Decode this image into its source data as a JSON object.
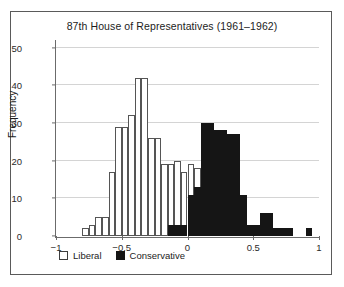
{
  "figure": {
    "background": "#ffffff",
    "frame_color": "#5a5a5a"
  },
  "legend": {
    "position": "bottom-left",
    "entries": [
      {
        "label": "Liberal",
        "color": "#ffffff",
        "edge": "#3d3d3d",
        "swatch": "hollow-square-icon"
      },
      {
        "label": "Conservative",
        "color": "#151515",
        "edge": "#151515",
        "swatch": "filled-square-icon"
      }
    ]
  },
  "chart_data": {
    "type": "bar",
    "title": "87th House of Representatives (1961–1962)",
    "subtitle": "",
    "xlabel": "",
    "ylabel": "Frequency",
    "xlim": [
      -1,
      1
    ],
    "ylim": [
      0,
      52
    ],
    "xticks": [
      -1,
      -0.5,
      0,
      0.5,
      1
    ],
    "xtick_labels": [
      "−1",
      "−0.5",
      "0",
      "0.5",
      "1"
    ],
    "yticks": [
      0,
      10,
      20,
      30,
      40,
      50
    ],
    "ytick_labels": [
      "0",
      "10",
      "20",
      "30",
      "40",
      "50"
    ],
    "grid": "horizontal",
    "grid_color": "#d4d4d4",
    "bin_width": 0.05,
    "series": [
      {
        "name": "Liberal",
        "color": "#ffffff",
        "edge_color": "#555555",
        "bins": [
          {
            "x0": -0.8,
            "x1": -0.75,
            "value": 2
          },
          {
            "x0": -0.75,
            "x1": -0.7,
            "value": 3
          },
          {
            "x0": -0.7,
            "x1": -0.65,
            "value": 5
          },
          {
            "x0": -0.65,
            "x1": -0.6,
            "value": 5
          },
          {
            "x0": -0.6,
            "x1": -0.55,
            "value": 17
          },
          {
            "x0": -0.55,
            "x1": -0.5,
            "value": 29
          },
          {
            "x0": -0.5,
            "x1": -0.45,
            "value": 29
          },
          {
            "x0": -0.45,
            "x1": -0.4,
            "value": 32
          },
          {
            "x0": -0.4,
            "x1": -0.35,
            "value": 42
          },
          {
            "x0": -0.35,
            "x1": -0.3,
            "value": 42
          },
          {
            "x0": -0.3,
            "x1": -0.25,
            "value": 26
          },
          {
            "x0": -0.25,
            "x1": -0.2,
            "value": 26
          },
          {
            "x0": -0.2,
            "x1": -0.15,
            "value": 19
          },
          {
            "x0": -0.15,
            "x1": -0.1,
            "value": 19
          },
          {
            "x0": -0.1,
            "x1": -0.05,
            "value": 20
          },
          {
            "x0": -0.05,
            "x1": 0.0,
            "value": 17
          },
          {
            "x0": 0.0,
            "x1": 0.05,
            "value": 19
          },
          {
            "x0": 0.05,
            "x1": 0.1,
            "value": 18
          }
        ]
      },
      {
        "name": "Conservative",
        "color": "#151515",
        "edge_color": "#151515",
        "bins": [
          {
            "x0": -0.15,
            "x1": -0.1,
            "value": 3
          },
          {
            "x0": -0.1,
            "x1": -0.05,
            "value": 3
          },
          {
            "x0": -0.05,
            "x1": 0.0,
            "value": 3
          },
          {
            "x0": 0.0,
            "x1": 0.05,
            "value": 11
          },
          {
            "x0": 0.05,
            "x1": 0.1,
            "value": 13
          },
          {
            "x0": 0.1,
            "x1": 0.15,
            "value": 30
          },
          {
            "x0": 0.15,
            "x1": 0.2,
            "value": 30
          },
          {
            "x0": 0.2,
            "x1": 0.25,
            "value": 28
          },
          {
            "x0": 0.25,
            "x1": 0.3,
            "value": 28
          },
          {
            "x0": 0.3,
            "x1": 0.35,
            "value": 27
          },
          {
            "x0": 0.35,
            "x1": 0.4,
            "value": 27
          },
          {
            "x0": 0.4,
            "x1": 0.45,
            "value": 11
          },
          {
            "x0": 0.45,
            "x1": 0.5,
            "value": 3
          },
          {
            "x0": 0.5,
            "x1": 0.55,
            "value": 3
          },
          {
            "x0": 0.55,
            "x1": 0.6,
            "value": 6
          },
          {
            "x0": 0.6,
            "x1": 0.65,
            "value": 6
          },
          {
            "x0": 0.65,
            "x1": 0.7,
            "value": 2
          },
          {
            "x0": 0.7,
            "x1": 0.75,
            "value": 2
          },
          {
            "x0": 0.75,
            "x1": 0.8,
            "value": 2
          },
          {
            "x0": 0.9,
            "x1": 0.95,
            "value": 2
          }
        ]
      }
    ]
  }
}
